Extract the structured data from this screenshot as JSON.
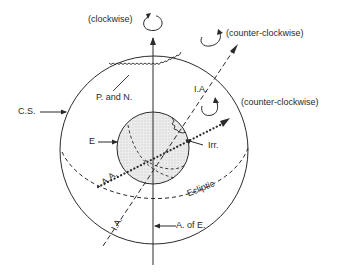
{
  "diagram": {
    "type": "celestial-sphere-diagram",
    "colors": {
      "ink": "#2a2a2a",
      "earth_fill": "#e6e6e6",
      "background": "#ffffff"
    },
    "labels": {
      "clockwise": "(clockwise)",
      "counter_clockwise_top": "(counter-clockwise)",
      "counter_clockwise_side": "(counter-clockwise)",
      "pn": "P. and N.",
      "ia_top": "I.A.",
      "ia_bottom": "I.A.",
      "cs": "C.S.",
      "e": "E",
      "irr": "Irr.",
      "aa": "A.A.",
      "ecliptic": "Ecliptic",
      "aoe": "A. of E."
    },
    "elements": [
      {
        "id": "celestial-sphere",
        "label": "C.S."
      },
      {
        "id": "earth",
        "label": "E"
      },
      {
        "id": "axis-of-ecliptic",
        "label": "A. of E.",
        "rotation": "clockwise"
      },
      {
        "id": "instantaneous-axis",
        "label": "I.A.",
        "rotation": "counter-clockwise"
      },
      {
        "id": "angular-axis",
        "label": "A.A.",
        "rotation": "counter-clockwise"
      },
      {
        "id": "ecliptic",
        "label": "Ecliptic"
      },
      {
        "id": "precession-nutation",
        "label": "P. and N."
      },
      {
        "id": "irregularities",
        "label": "Irr."
      }
    ]
  }
}
